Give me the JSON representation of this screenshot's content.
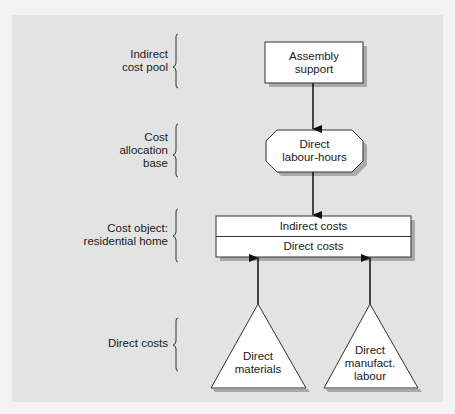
{
  "diagram": {
    "background": "#e3e3e3",
    "levels": [
      {
        "label_lines": [
          "Indirect",
          "cost pool"
        ]
      },
      {
        "label_lines": [
          "Cost",
          "allocation",
          "base"
        ]
      },
      {
        "label_lines": [
          "Cost object:",
          "residential home"
        ]
      },
      {
        "label_lines": [
          "Direct costs"
        ]
      }
    ],
    "nodes": {
      "assembly_support": {
        "shape": "rectangle",
        "lines": [
          "Assembly",
          "support"
        ]
      },
      "direct_labour_hours": {
        "shape": "octagon",
        "lines": [
          "Direct",
          "labour-hours"
        ]
      },
      "cost_object": {
        "shape": "rectangle",
        "rows": [
          "Indirect costs",
          "Direct costs"
        ]
      },
      "direct_materials": {
        "shape": "triangle",
        "lines": [
          "Direct",
          "materials"
        ]
      },
      "direct_manufact_labour": {
        "shape": "triangle",
        "lines": [
          "Direct",
          "manufact.",
          "labour"
        ]
      }
    },
    "edges": [
      {
        "from": "assembly_support",
        "to": "direct_labour_hours"
      },
      {
        "from": "direct_labour_hours",
        "to": "cost_object.Indirect costs"
      },
      {
        "from": "direct_materials",
        "to": "cost_object.Direct costs"
      },
      {
        "from": "direct_manufact_labour",
        "to": "cost_object.Direct costs"
      }
    ]
  }
}
